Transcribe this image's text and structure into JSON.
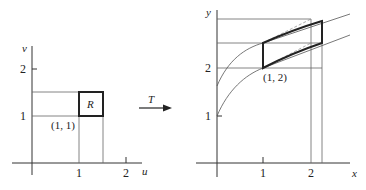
{
  "left_plot": {
    "h_axis_label": "u",
    "v_axis_label": "v",
    "h_ticks": [
      "1",
      "2"
    ],
    "v_ticks": [
      "1",
      "2"
    ],
    "region_label": "R",
    "corner_label": "(1, 1)"
  },
  "transform": {
    "label": "T"
  },
  "right_plot": {
    "h_axis_label": "x",
    "v_axis_label": "y",
    "h_ticks": [
      "1",
      "2"
    ],
    "v_ticks": [
      "1",
      "2"
    ],
    "corner_label": "(1, 2)"
  },
  "colors": {
    "ink": "#222222",
    "thin_line": "#555555"
  }
}
